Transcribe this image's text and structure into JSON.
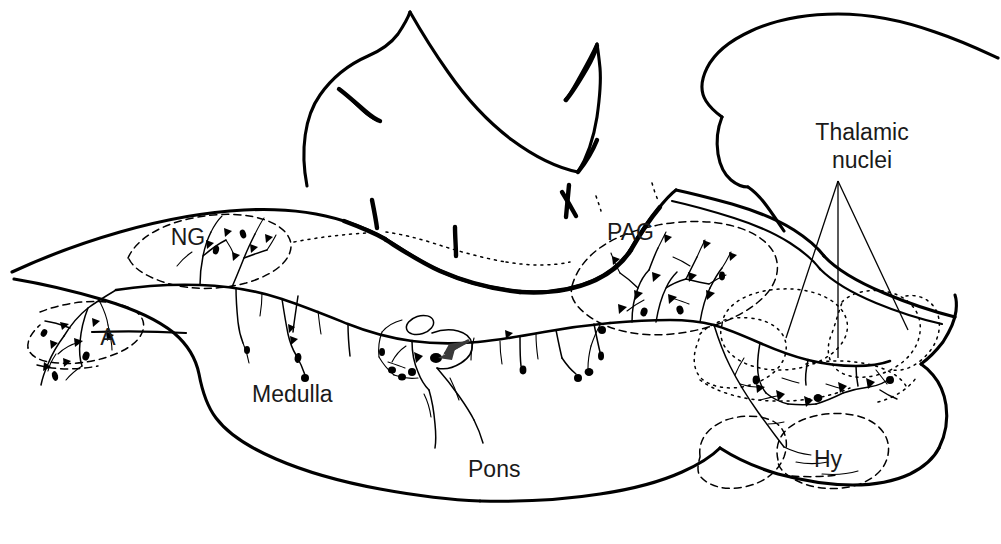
{
  "figure": {
    "background_color": "#ffffff",
    "ink_color": "#000000",
    "width": 1001,
    "height": 544
  },
  "labels": [
    {
      "id": "ng",
      "text": "NG",
      "x": 188,
      "y": 245,
      "size": 23,
      "name": "region-label-ng"
    },
    {
      "id": "a",
      "text": "A",
      "x": 108,
      "y": 345,
      "size": 23,
      "name": "region-label-a"
    },
    {
      "id": "medulla",
      "text": "Medulla",
      "x": 252,
      "y": 402,
      "size": 23,
      "name": "region-label-medulla"
    },
    {
      "id": "pons",
      "text": "Pons",
      "x": 468,
      "y": 477,
      "size": 23,
      "name": "region-label-pons"
    },
    {
      "id": "pag",
      "text": "PAG",
      "x": 607,
      "y": 240,
      "size": 23,
      "name": "region-label-pag"
    },
    {
      "id": "hy",
      "text": "Hy",
      "x": 814,
      "y": 467,
      "size": 23,
      "name": "region-label-hy"
    }
  ],
  "callout": {
    "name": "thalamic-nuclei-callout",
    "line1": "Thalamic",
    "line2": "nuclei",
    "line1_x": 862,
    "line1_y": 140,
    "line2_x": 862,
    "line2_y": 168,
    "apex_x": 838,
    "apex_y": 181,
    "targets": [
      {
        "x": 786,
        "y": 338
      },
      {
        "x": 838,
        "y": 358
      },
      {
        "x": 908,
        "y": 330
      }
    ]
  },
  "annotation_arrow": {
    "name": "branch-point-arrow",
    "tip_x": 435,
    "tip_y": 357,
    "tail_x": 466,
    "tail_y": 342,
    "color": "#3a3a3a"
  },
  "regions": [
    {
      "id": "ng",
      "label": "NG",
      "description": "nucleus gracilis, dashed outline, dorsal medulla"
    },
    {
      "id": "a",
      "label": "A",
      "description": "area postrema / caudal nucleus, dashed outline"
    },
    {
      "id": "pag",
      "label": "PAG",
      "description": "periaqueductal gray, dashed outline, midbrain"
    },
    {
      "id": "hy",
      "label": "Hy",
      "description": "hypothalamus, dashed outline, ventral diencephalon"
    },
    {
      "id": "thalamus",
      "label": "Thalamic nuclei",
      "description": "dotted subdivisions of thalamus"
    },
    {
      "id": "medulla",
      "label": "Medulla",
      "description": "brainstem medulla, solid outline"
    },
    {
      "id": "pons",
      "label": "Pons",
      "description": "brainstem pons, solid outline"
    },
    {
      "id": "cerebellum",
      "label": "",
      "description": "cerebellar outline with folia notch, unlabeled"
    },
    {
      "id": "cortex",
      "label": "",
      "description": "cerebral hemisphere outline, unlabeled"
    }
  ]
}
